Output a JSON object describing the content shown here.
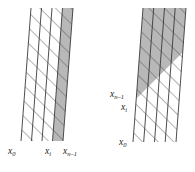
{
  "figure": {
    "title": "",
    "background_color": "#ffffff",
    "width": 195,
    "height": 172,
    "stroke_color": "#3a3a3a",
    "hatch_color": "#4a4a4a",
    "shaded_fill": "#b8b8b8",
    "unshaded_fill": "#ffffff"
  },
  "left_group": {
    "name": "left-column-group",
    "column_count": 4,
    "shaded_columns": [
      3
    ],
    "top_y": 8,
    "bottom_y": 141,
    "shear": "columns lean right going up",
    "labels": [
      {
        "id": "x0",
        "base": "x",
        "sub": "0",
        "x": 8,
        "y": 149
      },
      {
        "id": "xi",
        "base": "x",
        "sub": "i",
        "x": 45,
        "y": 149
      },
      {
        "id": "xn1",
        "base": "x",
        "sub": "n–1",
        "x": 63,
        "y": 149
      }
    ]
  },
  "right_group": {
    "name": "right-column-group",
    "column_count": 4,
    "shaded_region": "upper diagonal band across all columns",
    "top_y": 8,
    "bottom_y": 142,
    "shear": "columns lean right going up",
    "labels": [
      {
        "id": "xn1",
        "base": "x",
        "sub": "n–1",
        "x": 112,
        "y": 92
      },
      {
        "id": "xi",
        "base": "x",
        "sub": "i",
        "x": 122,
        "y": 105
      },
      {
        "id": "x0",
        "base": "x",
        "sub": "0",
        "x": 120,
        "y": 140
      }
    ]
  },
  "labels_text": {
    "x_zero": "x",
    "x_zero_sub": "0",
    "x_i": "x",
    "x_i_sub": "i",
    "x_n_minus_1": "x",
    "x_n_minus_1_sub": "n–1"
  }
}
